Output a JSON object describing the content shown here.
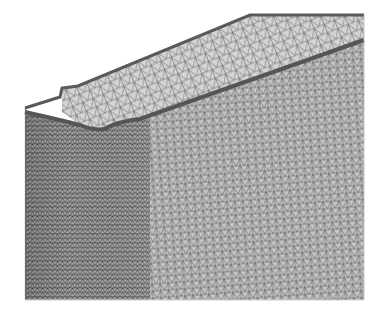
{
  "figure": {
    "description": "Finite element triangular surface mesh of a thin-walled channel/box profile with a rolled lip, shown in 3D perspective",
    "render_style": "wireframe-triangles",
    "colors": {
      "background": "#ffffff",
      "face_fine": "#9a9a9a",
      "face_coarse": "#c4c4c4",
      "mesh_line": "#4a4a4a",
      "edge_band": "#5a5a5a"
    },
    "geometry": {
      "outer_top_edge": [
        [
          25,
          108
        ],
        [
          60,
          97
        ],
        [
          62,
          88
        ],
        [
          78,
          86
        ],
        [
          250,
          15
        ],
        [
          364,
          15
        ]
      ],
      "inner_lip_edge": [
        [
          25,
          112
        ],
        [
          80,
          125
        ],
        [
          100,
          131
        ],
        [
          120,
          123
        ],
        [
          140,
          119
        ],
        [
          364,
          40
        ]
      ],
      "right_edge_x": 364,
      "left_edge_x": 25,
      "bottom_edge_y": 300
    }
  }
}
